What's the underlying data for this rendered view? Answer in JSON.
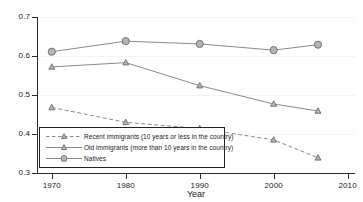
{
  "chart_data": {
    "type": "line",
    "title": "",
    "subtitle": "",
    "xlabel": "Year",
    "ylabel": "",
    "xlim": [
      1968,
      2011
    ],
    "ylim": [
      0.3,
      0.7
    ],
    "grid": true,
    "legend_position": "inside lower-left",
    "x_ticks": [
      "1970",
      "1980",
      "1990",
      "2000",
      "2010"
    ],
    "x_tick_values": [
      1970,
      1980,
      1990,
      2000,
      2010
    ],
    "y_ticks": [
      "0.3",
      "0.4",
      "0.5",
      "0.6",
      "0.7"
    ],
    "y_tick_values": [
      0.3,
      0.4,
      0.5,
      0.6,
      0.7
    ],
    "x": [
      1970,
      1980,
      1990,
      2000,
      2006
    ],
    "series": [
      {
        "name": "Recent immigrants (10 years or less in the country)",
        "values": [
          0.468,
          0.43,
          0.414,
          0.385,
          0.339
        ],
        "marker": "triangle",
        "linestyle": "dashed",
        "color": "#8a8a8a"
      },
      {
        "name": "Old immigrants (more than 10 years in the country)",
        "values": [
          0.572,
          0.583,
          0.524,
          0.477,
          0.459
        ],
        "marker": "triangle",
        "linestyle": "solid",
        "color": "#8a8a8a"
      },
      {
        "name": "Natives",
        "values": [
          0.611,
          0.638,
          0.631,
          0.615,
          0.629
        ],
        "marker": "circle",
        "linestyle": "solid",
        "color": "#8a8a8a"
      }
    ]
  },
  "axis": {
    "x_title": "Year"
  },
  "legend": {
    "entries": [
      {
        "label": "Recent immigrants (10 years or less in the country)"
      },
      {
        "label": "Old immigrants (more than 10 years in the country)"
      },
      {
        "label": "Natives"
      }
    ]
  },
  "colors": {
    "line": "#8a8a8a",
    "marker_fill": "#b4b4b4",
    "marker_stroke": "#6e6e6e",
    "axis": "#2b2b2b",
    "grid": "#f4f4f4",
    "background": "#ffffff",
    "text": "#1a1a1a"
  }
}
